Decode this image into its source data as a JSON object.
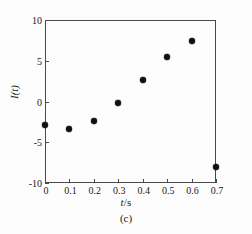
{
  "chart_data": {
    "type": "scatter",
    "title": "",
    "caption": "(c)",
    "xlabel": "t/s",
    "xlabel_symbol": "t",
    "xlabel_unit": "/s",
    "ylabel": "I(t)",
    "xlim": [
      0,
      0.7
    ],
    "ylim": [
      -10,
      10
    ],
    "grid": false,
    "legend": null,
    "marker_color": "#111111",
    "axis_color": "#4a4a4a",
    "xticks": [
      0,
      0.1,
      0.2,
      0.3,
      0.4,
      0.5,
      0.6,
      0.7
    ],
    "xtick_labels": [
      "0",
      "0.1",
      "0.2",
      "0.3",
      "0.4",
      "0.5",
      "0.6",
      "0.7"
    ],
    "yticks": [
      10,
      5,
      0,
      -5,
      -10
    ],
    "ytick_labels": [
      "10",
      "5",
      "0",
      "-5",
      "-10"
    ],
    "x": [
      0,
      0.1,
      0.2,
      0.3,
      0.4,
      0.5,
      0.6,
      0.7
    ],
    "values": [
      -2.9,
      -3.4,
      -2.4,
      -0.15,
      2.6,
      5.5,
      7.4,
      -8.0
    ],
    "points": [
      {
        "x": 0,
        "y": -2.9
      },
      {
        "x": 0.1,
        "y": -3.4
      },
      {
        "x": 0.2,
        "y": -2.4
      },
      {
        "x": 0.3,
        "y": -0.15
      },
      {
        "x": 0.4,
        "y": 2.6
      },
      {
        "x": 0.5,
        "y": 5.5
      },
      {
        "x": 0.6,
        "y": 7.4
      },
      {
        "x": 0.7,
        "y": -8.0
      }
    ]
  }
}
